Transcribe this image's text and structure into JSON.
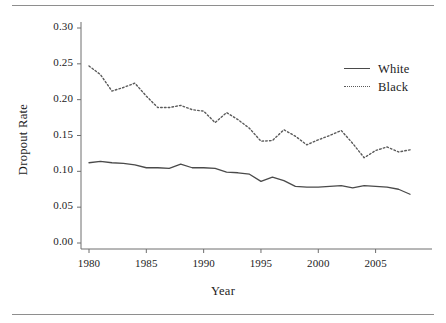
{
  "chart_data": {
    "type": "line",
    "title": "",
    "xlabel": "Year",
    "ylabel": "Dropout Rate",
    "xlim": [
      1979,
      2009
    ],
    "ylim": [
      0.0,
      0.305
    ],
    "grid": false,
    "legend_position": "top-right",
    "x_ticks": [
      "1980",
      "1985",
      "1990",
      "1995",
      "2000",
      "2005"
    ],
    "x_tick_values": [
      1980,
      1985,
      1990,
      1995,
      2000,
      2005
    ],
    "y_ticks": [
      "0.00",
      "0.05",
      "0.10",
      "0.15",
      "0.20",
      "0.25",
      "0.30"
    ],
    "y_tick_values": [
      0.0,
      0.05,
      0.1,
      0.15,
      0.2,
      0.25,
      0.3
    ],
    "x": [
      1980,
      1981,
      1982,
      1983,
      1984,
      1985,
      1986,
      1987,
      1988,
      1989,
      1990,
      1991,
      1992,
      1993,
      1994,
      1995,
      1996,
      1997,
      1998,
      1999,
      2000,
      2001,
      2002,
      2003,
      2004,
      2005,
      2006,
      2007,
      2008
    ],
    "series": [
      {
        "name": "White",
        "style": "solid",
        "color": "#4a4a4a",
        "values": [
          0.112,
          0.114,
          0.112,
          0.111,
          0.109,
          0.105,
          0.105,
          0.104,
          0.11,
          0.105,
          0.105,
          0.104,
          0.099,
          0.098,
          0.096,
          0.086,
          0.092,
          0.087,
          0.079,
          0.078,
          0.078,
          0.079,
          0.08,
          0.077,
          0.08,
          0.079,
          0.078,
          0.075,
          0.068
        ]
      },
      {
        "name": "Black",
        "style": "dotted",
        "color": "#5a5a5a",
        "values": [
          0.247,
          0.235,
          0.212,
          0.217,
          0.223,
          0.205,
          0.189,
          0.189,
          0.192,
          0.186,
          0.184,
          0.168,
          0.182,
          0.172,
          0.16,
          0.142,
          0.143,
          0.158,
          0.149,
          0.137,
          0.144,
          0.15,
          0.157,
          0.139,
          0.119,
          0.129,
          0.134,
          0.127,
          0.13
        ]
      }
    ]
  },
  "legend": {
    "items": [
      {
        "label": "White",
        "style": "solid"
      },
      {
        "label": "Black",
        "style": "dotted"
      }
    ]
  }
}
